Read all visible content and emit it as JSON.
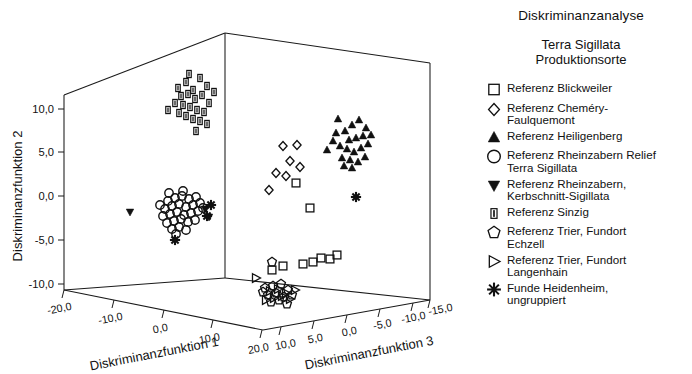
{
  "legend": {
    "title": "Diskriminanzanalyse",
    "subtitle_line1": "Terra Sigillata",
    "subtitle_line2": "Produktionsorte",
    "items": [
      {
        "marker": "square-open",
        "label": "Referenz Blickweiler"
      },
      {
        "marker": "diamond-open",
        "label": "Referenz Cheméry-\nFaulquemont"
      },
      {
        "marker": "triangle-up-filled",
        "label": "Referenz Heiligenberg"
      },
      {
        "marker": "circle-open",
        "label": "Referenz Rheinzabern Relief\nTerra Sigillata"
      },
      {
        "marker": "triangle-down-filled",
        "label": "Referenz Rheinzabern,\nKerbschnitt-Sigillata"
      },
      {
        "marker": "bar-square-filled",
        "label": "Referenz Sinzig"
      },
      {
        "marker": "pentagon-open",
        "label": "Referenz Trier, Fundort\nEchzell"
      },
      {
        "marker": "triangle-right-open",
        "label": "Referenz Trier, Fundort\nLangenhain"
      },
      {
        "marker": "asterisk-filled",
        "label": "Funde Heidenheim,\nungruppiert"
      }
    ]
  },
  "chart_data": {
    "type": "scatter",
    "title": "Diskriminanzanalyse",
    "subtitle": "Terra Sigillata Produktionsorte",
    "projection": "3d",
    "grid": false,
    "legend_position": "right",
    "xlabel": "Diskriminanzfunktion 1",
    "ylabel": "Diskriminanzfunktion 2",
    "zlabel": "Diskriminanzfunktion 3",
    "x_ticks": [
      "-20,0",
      "-10,0",
      "0,0",
      "10,0",
      "20,0"
    ],
    "y_ticks": [
      "10,0",
      "5,0",
      "0,0",
      "-5,0",
      "-10,0"
    ],
    "z_ticks": [
      "10,0",
      "5,0",
      "0,0",
      "-5,0",
      "-10,0",
      "-15,0"
    ],
    "xlim": [
      -25,
      25
    ],
    "ylim": [
      -13,
      13
    ],
    "zlim": [
      -15,
      10
    ],
    "z_reversed": true,
    "series": [
      {
        "name": "Referenz Blickweiler",
        "marker": "square-open",
        "points": [
          [
            310,
            208
          ],
          [
            296,
            183
          ],
          [
            283,
            266
          ],
          [
            303,
            264
          ],
          [
            313,
            262
          ],
          [
            321,
            258
          ],
          [
            330,
            259
          ],
          [
            337,
            255
          ],
          [
            272,
            270
          ]
        ]
      },
      {
        "name": "Referenz Cheméry-Faulquemont",
        "marker": "diamond-open",
        "points": [
          [
            283,
            146
          ],
          [
            297,
            145
          ],
          [
            290,
            161
          ],
          [
            300,
            167
          ],
          [
            286,
            176
          ],
          [
            276,
            173
          ],
          [
            269,
            190
          ]
        ]
      },
      {
        "name": "Referenz Heiligenberg",
        "marker": "triangle-up-filled",
        "points": [
          [
            338,
            119
          ],
          [
            345,
            131
          ],
          [
            352,
            125
          ],
          [
            359,
            120
          ],
          [
            366,
            128
          ],
          [
            349,
            140
          ],
          [
            356,
            138
          ],
          [
            363,
            136
          ],
          [
            340,
            146
          ],
          [
            347,
            149
          ],
          [
            354,
            152
          ],
          [
            361,
            148
          ],
          [
            368,
            144
          ],
          [
            333,
            141
          ],
          [
            342,
            158
          ],
          [
            350,
            160
          ],
          [
            358,
            162
          ],
          [
            365,
            157
          ],
          [
            371,
            135
          ],
          [
            344,
            166
          ],
          [
            352,
            168
          ],
          [
            327,
            150
          ],
          [
            336,
            133
          ]
        ]
      },
      {
        "name": "Referenz Rheinzabern Relief Terra Sigillata",
        "marker": "circle-open",
        "points": [
          [
            168,
            201
          ],
          [
            175,
            198
          ],
          [
            182,
            196
          ],
          [
            189,
            199
          ],
          [
            196,
            197
          ],
          [
            165,
            209
          ],
          [
            172,
            206
          ],
          [
            179,
            204
          ],
          [
            186,
            207
          ],
          [
            193,
            205
          ],
          [
            200,
            203
          ],
          [
            163,
            216
          ],
          [
            170,
            214
          ],
          [
            177,
            212
          ],
          [
            184,
            215
          ],
          [
            191,
            213
          ],
          [
            198,
            211
          ],
          [
            167,
            223
          ],
          [
            174,
            221
          ],
          [
            181,
            219
          ],
          [
            188,
            222
          ],
          [
            195,
            220
          ],
          [
            172,
            229
          ],
          [
            179,
            227
          ],
          [
            186,
            230
          ],
          [
            160,
            205
          ],
          [
            203,
            208
          ],
          [
            176,
            234
          ],
          [
            169,
            193
          ],
          [
            183,
            191
          ]
        ]
      },
      {
        "name": "Referenz Rheinzabern, Kerbschnitt-Sigillata",
        "marker": "triangle-down-filled",
        "points": [
          [
            130,
            212
          ],
          [
            205,
            209
          ],
          [
            209,
            217
          ]
        ]
      },
      {
        "name": "Referenz Sinzig",
        "marker": "bar-square-filled",
        "points": [
          [
            178,
            88
          ],
          [
            186,
            82
          ],
          [
            193,
            90
          ],
          [
            200,
            78
          ],
          [
            207,
            86
          ],
          [
            181,
            96
          ],
          [
            188,
            94
          ],
          [
            195,
            99
          ],
          [
            202,
            95
          ],
          [
            209,
            103
          ],
          [
            175,
            103
          ],
          [
            183,
            105
          ],
          [
            190,
            107
          ],
          [
            197,
            110
          ],
          [
            204,
            112
          ],
          [
            179,
            113
          ],
          [
            186,
            116
          ],
          [
            193,
            119
          ],
          [
            200,
            121
          ],
          [
            168,
            110
          ],
          [
            214,
            92
          ],
          [
            207,
            124
          ],
          [
            196,
            131
          ],
          [
            189,
            74
          ]
        ]
      },
      {
        "name": "Referenz Trier, Fundort Echzell",
        "marker": "pentagon-open",
        "points": [
          [
            272,
            262
          ],
          [
            265,
            288
          ],
          [
            273,
            286
          ],
          [
            281,
            284
          ],
          [
            288,
            290
          ],
          [
            268,
            295
          ],
          [
            276,
            293
          ],
          [
            284,
            297
          ],
          [
            271,
            302
          ],
          [
            279,
            300
          ],
          [
            287,
            304
          ],
          [
            263,
            292
          ],
          [
            292,
            295
          ]
        ]
      },
      {
        "name": "Referenz Trier, Fundort Langenhain",
        "marker": "triangle-right-open",
        "points": [
          [
            256,
            278
          ],
          [
            270,
            291
          ],
          [
            278,
            289
          ],
          [
            286,
            293
          ],
          [
            295,
            290
          ],
          [
            274,
            298
          ],
          [
            282,
            296
          ],
          [
            266,
            300
          ],
          [
            290,
            299
          ]
        ]
      },
      {
        "name": "Funde Heidenheim, ungruppiert",
        "marker": "asterisk-filled",
        "points": [
          [
            211,
            205
          ],
          [
            207,
            216
          ],
          [
            175,
            240
          ],
          [
            356,
            197
          ]
        ]
      }
    ]
  }
}
